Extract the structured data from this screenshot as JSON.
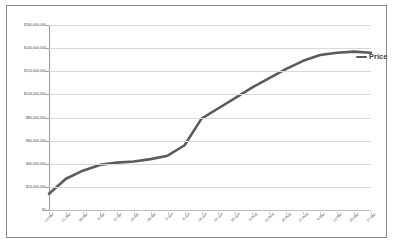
{
  "chart_data": {
    "type": "line",
    "title": "",
    "xlabel": "",
    "ylabel": "",
    "ylim": [
      0,
      160000000
    ],
    "ytick_step": 20000000,
    "grid": true,
    "legend_position": "right",
    "line_color": "#5b5b5b",
    "gridline_color": "#d9d9d9",
    "border_color": "#8a8a8a",
    "background_color": "#ffffff",
    "y_tick_labels": [
      "$160,000,000",
      "$140,000,000",
      "$120,000,000",
      "$100,000,000",
      "$80,000,000",
      "$60,000,000",
      "$40,000,000",
      "$20,000,000",
      "$0"
    ],
    "y_tick_values": [
      160000000,
      140000000,
      120000000,
      100000000,
      80000000,
      60000000,
      40000000,
      20000000,
      0
    ],
    "categories": [
      "14-Mar",
      "21-Mar",
      "28-Mar",
      "5-Apr",
      "12-Apr",
      "19-Apr",
      "26-Apr",
      "3-Jun",
      "9-Jun",
      "16-Jun",
      "23-Jun",
      "30-Jun",
      "6-Aug",
      "13-Aug",
      "20-Aug",
      "27-Aug",
      "6-Mar",
      "13-Mar",
      "20-Mar",
      "27-Mar"
    ],
    "series": [
      {
        "name": "Price",
        "values": [
          14000000,
          27000000,
          34000000,
          39000000,
          41000000,
          42000000,
          44000000,
          47000000,
          56000000,
          79000000,
          88000000,
          97000000,
          106000000,
          114000000,
          122000000,
          129000000,
          134000000,
          136000000,
          137000000,
          136000000
        ]
      }
    ]
  },
  "legend": {
    "label": "Price"
  }
}
